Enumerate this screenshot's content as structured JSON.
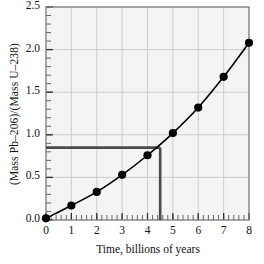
{
  "chart_data": {
    "type": "line",
    "title": "",
    "subtitle": "",
    "xlabel": "Time, billions of years",
    "ylabel": "(Mass Pb–206)/(Mass U–238)",
    "xlim": [
      0,
      8
    ],
    "ylim": [
      0.0,
      2.5
    ],
    "xticks": [
      0,
      1,
      2,
      3,
      4,
      5,
      6,
      7,
      8
    ],
    "xtick_labels": [
      "0",
      "1",
      "2",
      "3",
      "4",
      "5",
      "6",
      "7",
      "8"
    ],
    "yticks": [
      0.0,
      0.5,
      1.0,
      1.5,
      2.0,
      2.5
    ],
    "ytick_labels": [
      "0.0",
      "0.5",
      "1.0",
      "1.5",
      "2.0",
      "2.5"
    ],
    "x_minor_tick_step": 0.2,
    "y_minor_tick_step": 0.1,
    "grid": true,
    "grid_color": "#c9c9c9",
    "plot_bg": "#f4f4f4",
    "legend": null,
    "legend_position": "none",
    "series": [
      {
        "name": "Pb-206 / U-238 mass ratio",
        "marker": "filled-circle",
        "marker_color": "#000000",
        "line_color": "#000000",
        "x": [
          0,
          1,
          2,
          3,
          4,
          5,
          6,
          7,
          8
        ],
        "values": [
          0.02,
          0.17,
          0.33,
          0.53,
          0.76,
          1.02,
          1.32,
          1.68,
          2.08
        ]
      }
    ],
    "annotations": [
      {
        "name": "guide-lines",
        "type": "crosshair",
        "color": "#4a4a4a",
        "x": 4.5,
        "y": 0.85,
        "description": "Horizontal guide from y-axis at ratio 0.85 to curve, then vertical guide down to time axis at 4.5"
      }
    ]
  },
  "axes": {
    "y_axis_name": "(Mass Pb–206)/(Mass U–238)",
    "x_axis_name": "Time, billions of years"
  }
}
